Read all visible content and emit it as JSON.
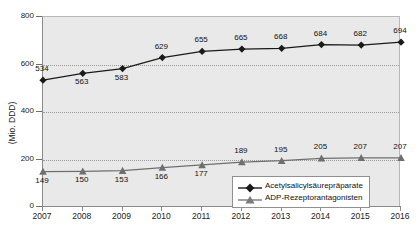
{
  "chart_data": {
    "type": "line",
    "title": "",
    "xlabel": "",
    "ylabel": "(Mio. DDD)",
    "categories": [
      "2007",
      "2008",
      "2009",
      "2010",
      "2011",
      "2012",
      "2013",
      "2014",
      "2015",
      "2016"
    ],
    "ylim": [
      0,
      800
    ],
    "yticks": [
      0,
      200,
      400,
      600,
      800
    ],
    "ytick_labels": [
      "0",
      "200",
      "400",
      "600",
      "800"
    ],
    "grid": "horizontal-dotted",
    "gridlines": [
      200,
      400,
      600
    ],
    "legend_position": "bottom-right",
    "series": [
      {
        "name": "Acetylsalicylsäurepräparate",
        "marker": "diamond",
        "color": "#1a1a1a",
        "values": [
          534,
          563,
          583,
          629,
          655,
          665,
          668,
          684,
          682,
          694
        ],
        "label_positions": [
          "above",
          "below",
          "below",
          "above",
          "above",
          "above",
          "above",
          "above",
          "above",
          "above"
        ]
      },
      {
        "name": "ADP-Rezeptorantagonisten",
        "marker": "triangle",
        "color": "#6f6f6f",
        "values": [
          149,
          150,
          153,
          166,
          177,
          189,
          195,
          205,
          207,
          207
        ],
        "label_positions": [
          "below",
          "below",
          "below",
          "below",
          "below",
          "above",
          "above",
          "above",
          "above",
          "above"
        ]
      }
    ]
  },
  "legend": {
    "items": [
      {
        "label": "Acetylsalicylsäurepräparate"
      },
      {
        "label": "ADP-Rezeptorantagonisten"
      }
    ]
  }
}
